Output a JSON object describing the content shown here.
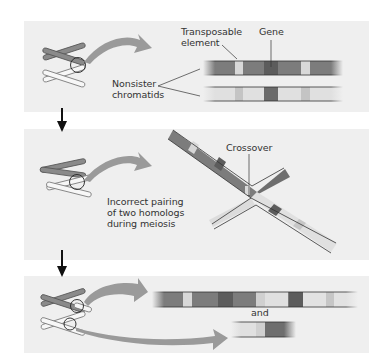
{
  "panels": [
    {
      "id": "normal-pairing",
      "labels": {
        "transposable_element": "Transposable\nelement",
        "transposable_line1": "Transposable",
        "transposable_line2": "element",
        "gene": "Gene",
        "nonsister_line1": "Nonsister",
        "nonsister_line2": "chromatids"
      }
    },
    {
      "id": "incorrect-pairing",
      "labels": {
        "crossover": "Crossover",
        "caption_line1": "Incorrect pairing",
        "caption_line2": "of two homologs",
        "caption_line3": "during meiosis"
      }
    },
    {
      "id": "result",
      "labels": {
        "and": "and"
      }
    }
  ],
  "colors": {
    "panel_bg": "#efefef",
    "dark_chromatid": "#7a7a7a",
    "light_chromatid": "#d4d4d4",
    "gene_band": "#5a5a5a",
    "transposon_band": "#dcdcdc",
    "arrow": "#9a9a9a",
    "flow_arrow": "#111111"
  }
}
